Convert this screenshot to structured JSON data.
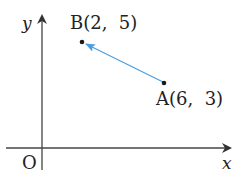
{
  "diagram": {
    "type": "coordinate-plane-vector",
    "axes": {
      "x_label": "x",
      "y_label": "y",
      "origin_label": "O"
    },
    "points": [
      {
        "name": "B",
        "label": "B(2,  5)",
        "x": 2,
        "y": 5
      },
      {
        "name": "A",
        "label": "A(6,  3)",
        "x": 6,
        "y": 3
      }
    ],
    "vector": {
      "from": "A",
      "to": "B",
      "color": "#4a9ee0"
    },
    "colors": {
      "axis": "#333333",
      "point": "#1a1a1a",
      "vector": "#4a9ee0"
    }
  }
}
